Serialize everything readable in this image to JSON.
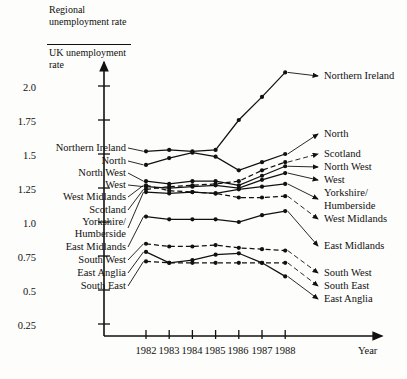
{
  "axis": {
    "y_title_numerator": "Regional unemployment rate",
    "y_title_denominator": "UK unemployment rate",
    "y_ticks": [
      "0.25",
      "0.5",
      "0.75",
      "1.0",
      "1.25",
      "1.5",
      "1.75",
      "2.0"
    ],
    "x_label": "Year",
    "x_ticks": [
      "1982",
      "1983",
      "1984",
      "1985",
      "1986",
      "1987",
      "1988"
    ]
  },
  "labels_left": [
    "Northern Ireland",
    "North",
    "North West",
    "West",
    "West Midlands",
    "Scotland",
    "Yorkshire/",
    "Humberside",
    "East Midlands",
    "South West",
    "East Anglia",
    "South East"
  ],
  "labels_right": [
    "Northern Ireland",
    "North",
    "Scotland",
    "North West",
    "West",
    "Yorkshire/",
    "Humberside",
    "West Midlands",
    "East Midlands",
    "South West",
    "South East",
    "East Anglia"
  ],
  "chart_data": {
    "type": "line",
    "title": "",
    "xlabel": "Year",
    "ylabel": "Regional unemployment rate / UK unemployment rate",
    "x": [
      1982,
      1983,
      1984,
      1985,
      1986,
      1987,
      1988
    ],
    "xlim": [
      1981.6,
      1988.6
    ],
    "ylim": [
      0,
      2.2
    ],
    "ytick_values": [
      0.25,
      0.5,
      0.75,
      1.0,
      1.25,
      1.5,
      1.75,
      2.0
    ],
    "grid": false,
    "legend": "endpoint-labels",
    "series": [
      {
        "name": "Northern Ireland",
        "style": "solid",
        "values": [
          1.52,
          1.53,
          1.52,
          1.53,
          1.75,
          1.92,
          2.1
        ]
      },
      {
        "name": "North",
        "style": "solid",
        "values": [
          1.42,
          1.47,
          1.51,
          1.48,
          1.38,
          1.44,
          1.5
        ]
      },
      {
        "name": "Scotland",
        "style": "dashed",
        "values": [
          1.24,
          1.26,
          1.27,
          1.28,
          1.3,
          1.38,
          1.44
        ]
      },
      {
        "name": "North West",
        "style": "solid",
        "values": [
          1.3,
          1.28,
          1.3,
          1.3,
          1.27,
          1.34,
          1.41
        ]
      },
      {
        "name": "West",
        "style": "solid",
        "values": [
          1.26,
          1.25,
          1.26,
          1.27,
          1.25,
          1.31,
          1.36
        ]
      },
      {
        "name": "Yorkshire/Humberside",
        "style": "solid",
        "values": [
          1.22,
          1.21,
          1.22,
          1.21,
          1.24,
          1.26,
          1.28
        ]
      },
      {
        "name": "West Midlands",
        "style": "dashed",
        "values": [
          1.27,
          1.23,
          1.22,
          1.21,
          1.18,
          1.18,
          1.19
        ]
      },
      {
        "name": "East Midlands",
        "style": "solid",
        "values": [
          1.04,
          1.02,
          1.02,
          1.02,
          1.0,
          1.05,
          1.08
        ]
      },
      {
        "name": "South West",
        "style": "dashed",
        "values": [
          0.84,
          0.82,
          0.82,
          0.83,
          0.81,
          0.8,
          0.79
        ]
      },
      {
        "name": "East Anglia",
        "style": "solid",
        "values": [
          0.78,
          0.7,
          0.72,
          0.76,
          0.77,
          0.7,
          0.6
        ]
      },
      {
        "name": "South East",
        "style": "dashed",
        "values": [
          0.71,
          0.7,
          0.7,
          0.7,
          0.7,
          0.7,
          0.7
        ]
      }
    ]
  }
}
